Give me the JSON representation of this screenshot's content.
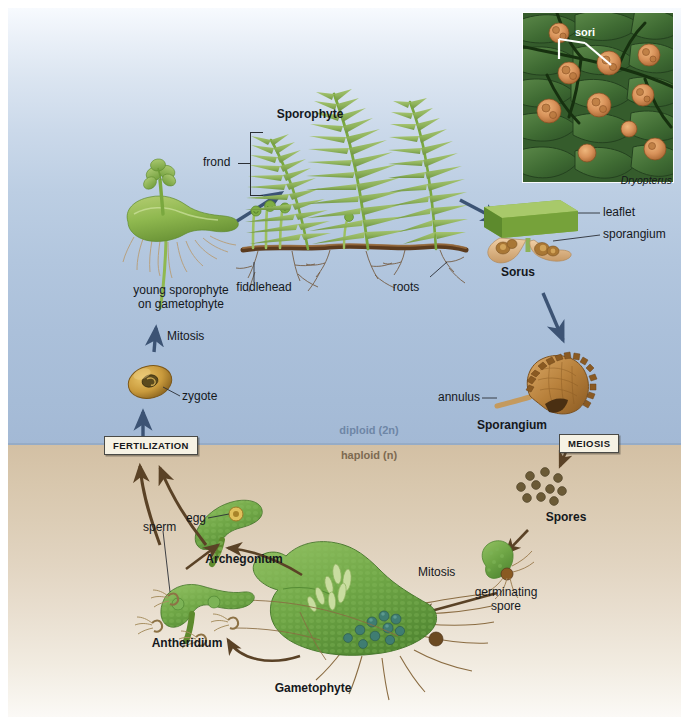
{
  "figure": {
    "phases": {
      "diploid": "diploid (2n)",
      "haploid": "haploid (n)"
    },
    "process_boxes": {
      "fertilization": "FERTILIZATION",
      "meiosis": "MEIOSIS"
    },
    "colors": {
      "diploid_bg_top": "#f7fafe",
      "diploid_bg_bottom": "#a3b9d5",
      "haploid_bg_top": "#d3c0a4",
      "haploid_bg_bottom": "#fbf9f6",
      "arrow_blue": "#3c5374",
      "arrow_brown": "#5a4226",
      "frond_green": "#8fb257",
      "gametophyte_green": "#6fa44a",
      "sporangium_brown": "#a6702f",
      "spore_brown": "#6b5a36",
      "text": "#15181c"
    }
  },
  "photo_inset": {
    "label": "sori",
    "caption": "Dryopterus"
  },
  "labels": {
    "sporophyte": "Sporophyte",
    "frond": "frond",
    "fiddlehead": "fiddlehead",
    "roots": "roots",
    "young_sporophyte_line1": "young sporophyte",
    "young_sporophyte_line2": "on gametophyte",
    "mitosis_upper": "Mitosis",
    "zygote": "zygote",
    "leaflet": "leaflet",
    "sporangium_callout": "sporangium",
    "sorus": "Sorus",
    "annulus": "annulus",
    "sporangium": "Sporangium",
    "spores": "Spores",
    "mitosis_lower": "Mitosis",
    "germinating_spore_line1": "germinating",
    "germinating_spore_line2": "spore",
    "gametophyte": "Gametophyte",
    "antheridium": "Antheridium",
    "archegonium": "Archegonium",
    "sperm": "sperm",
    "egg": "egg"
  },
  "icons": {
    "fern_frond": "fern-frond-icon",
    "fiddlehead": "fiddlehead-icon",
    "rhizome": "rhizome-icon",
    "sorus": "sorus-icon",
    "sporangium": "sporangium-icon",
    "spore_cluster": "spore-cluster-icon",
    "germinating_spore": "germinating-spore-icon",
    "gametophyte": "gametophyte-icon",
    "antheridium": "antheridium-icon",
    "archegonium": "archegonium-icon",
    "zygote": "zygote-icon",
    "young_sporophyte": "young-sporophyte-icon"
  }
}
